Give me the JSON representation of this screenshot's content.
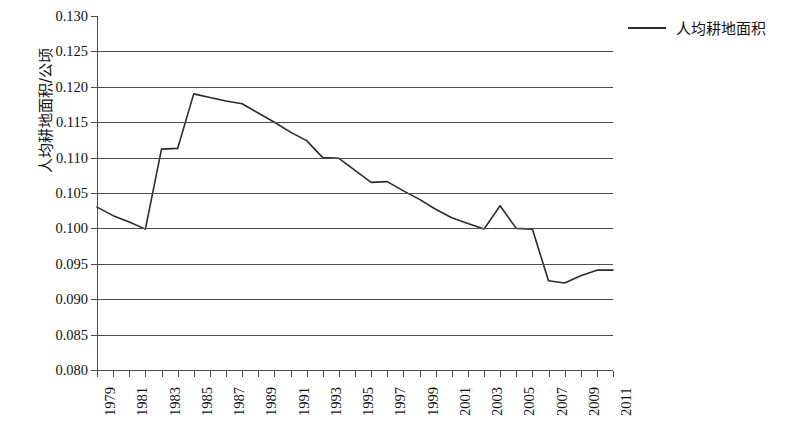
{
  "chart_data": {
    "type": "line",
    "title": "",
    "xlabel": "",
    "ylabel": "人均耕地面积/公顷",
    "ylim": [
      0.08,
      0.13
    ],
    "ytick_step": 0.005,
    "ytick_labels": [
      "0.130",
      "0.125",
      "0.120",
      "0.115",
      "0.110",
      "0.105",
      "0.100",
      "0.095",
      "0.090",
      "0.085",
      "0.080"
    ],
    "ytick_values": [
      0.13,
      0.125,
      0.12,
      0.115,
      0.11,
      0.105,
      0.1,
      0.095,
      0.09,
      0.085,
      0.08
    ],
    "xlim": [
      1979,
      2011
    ],
    "xtick_labels": [
      "1979",
      "1981",
      "1983",
      "1985",
      "1987",
      "1989",
      "1991",
      "1993",
      "1995",
      "1997",
      "1999",
      "2001",
      "2003",
      "2005",
      "2007",
      "2009",
      "2011"
    ],
    "grid": "horizontal",
    "legend_position": "top-right",
    "legend": [
      "人均耕地面积"
    ],
    "line_color": "#2b2b2b",
    "grid_color": "#4d4d4d",
    "background_color": "#ffffff",
    "categories": [
      1979,
      1980,
      1981,
      1982,
      1983,
      1984,
      1985,
      1986,
      1987,
      1988,
      1989,
      1990,
      1991,
      1992,
      1993,
      1994,
      1995,
      1996,
      1997,
      1998,
      1999,
      2000,
      2001,
      2002,
      2003,
      2004,
      2005,
      2006,
      2007,
      2008,
      2009,
      2010,
      2011
    ],
    "series": [
      {
        "name": "人均耕地面积",
        "values": [
          0.103,
          0.1018,
          0.1009,
          0.0999,
          0.1112,
          0.1113,
          0.119,
          0.1185,
          0.118,
          0.1176,
          0.1163,
          0.115,
          0.1136,
          0.1124,
          0.11,
          0.1099,
          0.1082,
          0.1065,
          0.1066,
          0.1053,
          0.1041,
          0.1027,
          0.1015,
          0.1007,
          0.0999,
          0.1032,
          0.1,
          0.0999,
          0.0926,
          0.0923,
          0.0933,
          0.0941,
          0.0941
        ]
      }
    ]
  }
}
